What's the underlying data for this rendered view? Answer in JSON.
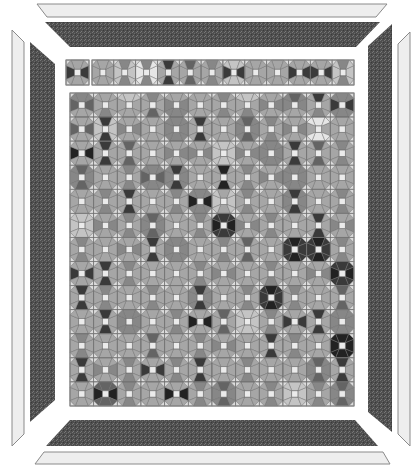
{
  "canvas": {
    "width": 413,
    "height": 474,
    "background": "#ffffff"
  },
  "palette": {
    "0": "#e6e6e6",
    "1": "#c4c4c4",
    "2": "#a6a6a6",
    "3": "#878787",
    "4": "#646464",
    "5": "#3a3a3a",
    "6": "#222222",
    "center": "#ebebeb",
    "corner": "#dcdcdc",
    "seam": "#6e6e6e",
    "border_dark": "#4e4e4e",
    "border_light": "#eeeeee",
    "border_outline": "#8a8a8a"
  },
  "borders": {
    "outer_light": {
      "top": [
        [
          37,
          4
        ],
        [
          387,
          4
        ],
        [
          376,
          17
        ],
        [
          47,
          17
        ]
      ],
      "bottom": [
        [
          44,
          452
        ],
        [
          383,
          452
        ],
        [
          390,
          464
        ],
        [
          35,
          464
        ]
      ],
      "left": [
        [
          12,
          30
        ],
        [
          24,
          42
        ],
        [
          24,
          434
        ],
        [
          12,
          446
        ]
      ],
      "right": [
        [
          410,
          32
        ],
        [
          398,
          44
        ],
        [
          398,
          434
        ],
        [
          410,
          446
        ]
      ]
    },
    "inner_dark": {
      "top": [
        [
          45,
          22
        ],
        [
          380,
          22
        ],
        [
          356,
          47
        ],
        [
          70,
          47
        ]
      ],
      "bottom": [
        [
          70,
          420
        ],
        [
          355,
          420
        ],
        [
          378,
          446
        ],
        [
          46,
          446
        ]
      ],
      "left": [
        [
          30,
          42
        ],
        [
          55,
          64
        ],
        [
          55,
          400
        ],
        [
          30,
          422
        ]
      ],
      "right": [
        [
          392,
          24
        ],
        [
          368,
          46
        ],
        [
          368,
          412
        ],
        [
          392,
          432
        ]
      ]
    }
  },
  "top_strip": {
    "y": 60,
    "height": 25,
    "first_cell": {
      "x": 66,
      "width": 23,
      "petals": [
        2,
        5,
        2,
        5
      ]
    },
    "cells_x": 92,
    "cells_width": 262,
    "cells": [
      [
        2,
        2,
        2,
        2
      ],
      [
        3,
        1,
        3,
        1
      ],
      [
        3,
        0,
        3,
        0
      ],
      [
        5,
        2,
        5,
        2
      ],
      [
        4,
        2,
        4,
        2
      ],
      [
        3,
        2,
        3,
        2
      ],
      [
        1,
        5,
        1,
        5
      ],
      [
        2,
        2,
        2,
        2
      ],
      [
        2,
        2,
        2,
        2
      ],
      [
        2,
        5,
        2,
        5
      ],
      [
        2,
        5,
        2,
        5
      ],
      [
        3,
        1,
        3,
        1
      ]
    ]
  },
  "main_grid": {
    "x": 70,
    "y": 93,
    "width": 284,
    "height": 313,
    "cols": 12,
    "rows": 13,
    "blocks": [
      [
        [
          3,
          4,
          2,
          4
        ],
        [
          2,
          2,
          3,
          2
        ],
        [
          1,
          2,
          2,
          2
        ],
        [
          3,
          2,
          4,
          2
        ],
        [
          2,
          3,
          3,
          3
        ],
        [
          2,
          2,
          2,
          2
        ],
        [
          3,
          2,
          3,
          2
        ],
        [
          1,
          2,
          3,
          2
        ],
        [
          2,
          3,
          2,
          3
        ],
        [
          4,
          3,
          2,
          3
        ],
        [
          5,
          2,
          3,
          2
        ],
        [
          3,
          5,
          3,
          5
        ]
      ],
      [
        [
          2,
          4,
          2,
          4
        ],
        [
          5,
          1,
          5,
          1
        ],
        [
          2,
          3,
          2,
          3
        ],
        [
          2,
          2,
          2,
          2
        ],
        [
          3,
          3,
          3,
          3
        ],
        [
          5,
          2,
          5,
          2
        ],
        [
          2,
          2,
          2,
          2
        ],
        [
          4,
          3,
          4,
          3
        ],
        [
          3,
          2,
          3,
          2
        ],
        [
          2,
          3,
          2,
          3
        ],
        [
          0,
          2,
          0,
          2
        ],
        [
          2,
          2,
          2,
          2
        ]
      ],
      [
        [
          2,
          6,
          2,
          6
        ],
        [
          5,
          2,
          5,
          2
        ],
        [
          4,
          2,
          4,
          2
        ],
        [
          2,
          2,
          2,
          2
        ],
        [
          2,
          3,
          2,
          3
        ],
        [
          2,
          3,
          2,
          3
        ],
        [
          1,
          1,
          1,
          1
        ],
        [
          2,
          3,
          2,
          3
        ],
        [
          3,
          3,
          3,
          3
        ],
        [
          5,
          2,
          5,
          2
        ],
        [
          4,
          2,
          4,
          2
        ],
        [
          3,
          2,
          3,
          2
        ]
      ],
      [
        [
          4,
          3,
          4,
          3
        ],
        [
          2,
          2,
          2,
          2
        ],
        [
          3,
          2,
          3,
          2
        ],
        [
          3,
          4,
          3,
          4
        ],
        [
          5,
          3,
          5,
          3
        ],
        [
          2,
          2,
          2,
          2
        ],
        [
          6,
          2,
          6,
          2
        ],
        [
          3,
          2,
          3,
          2
        ],
        [
          2,
          3,
          2,
          3
        ],
        [
          3,
          3,
          3,
          3
        ],
        [
          2,
          2,
          2,
          2
        ],
        [
          2,
          2,
          2,
          2
        ]
      ],
      [
        [
          2,
          2,
          2,
          2
        ],
        [
          3,
          2,
          3,
          2
        ],
        [
          5,
          2,
          5,
          2
        ],
        [
          2,
          2,
          2,
          2
        ],
        [
          3,
          2,
          3,
          2
        ],
        [
          3,
          6,
          3,
          6
        ],
        [
          2,
          1,
          2,
          1
        ],
        [
          3,
          2,
          3,
          2
        ],
        [
          2,
          2,
          2,
          2
        ],
        [
          5,
          3,
          5,
          3
        ],
        [
          2,
          2,
          2,
          2
        ],
        [
          3,
          2,
          3,
          2
        ]
      ],
      [
        [
          1,
          1,
          1,
          1
        ],
        [
          2,
          3,
          2,
          3
        ],
        [
          3,
          2,
          3,
          2
        ],
        [
          4,
          3,
          4,
          3
        ],
        [
          2,
          2,
          2,
          2
        ],
        [
          3,
          2,
          3,
          2
        ],
        [
          5,
          6,
          5,
          6
        ],
        [
          2,
          3,
          2,
          3
        ],
        [
          3,
          2,
          3,
          2
        ],
        [
          2,
          2,
          2,
          2
        ],
        [
          5,
          2,
          5,
          2
        ],
        [
          2,
          3,
          2,
          3
        ]
      ],
      [
        [
          3,
          2,
          3,
          2
        ],
        [
          2,
          2,
          2,
          2
        ],
        [
          2,
          3,
          2,
          3
        ],
        [
          5,
          2,
          5,
          2
        ],
        [
          3,
          3,
          3,
          3
        ],
        [
          2,
          2,
          2,
          2
        ],
        [
          3,
          2,
          3,
          2
        ],
        [
          4,
          2,
          4,
          2
        ],
        [
          2,
          2,
          2,
          2
        ],
        [
          6,
          5,
          6,
          5
        ],
        [
          6,
          5,
          6,
          5
        ],
        [
          3,
          2,
          3,
          2
        ]
      ],
      [
        [
          2,
          5,
          2,
          5
        ],
        [
          5,
          2,
          5,
          2
        ],
        [
          3,
          2,
          3,
          2
        ],
        [
          2,
          2,
          2,
          2
        ],
        [
          2,
          2,
          2,
          2
        ],
        [
          3,
          2,
          3,
          2
        ],
        [
          2,
          3,
          2,
          3
        ],
        [
          2,
          2,
          2,
          2
        ],
        [
          3,
          2,
          3,
          2
        ],
        [
          2,
          2,
          2,
          2
        ],
        [
          2,
          3,
          2,
          3
        ],
        [
          5,
          6,
          5,
          6
        ]
      ],
      [
        [
          5,
          2,
          5,
          2
        ],
        [
          3,
          2,
          3,
          2
        ],
        [
          2,
          2,
          2,
          2
        ],
        [
          3,
          2,
          3,
          2
        ],
        [
          2,
          2,
          2,
          2
        ],
        [
          5,
          3,
          5,
          3
        ],
        [
          2,
          2,
          2,
          2
        ],
        [
          3,
          2,
          3,
          2
        ],
        [
          6,
          5,
          6,
          5
        ],
        [
          3,
          2,
          3,
          2
        ],
        [
          2,
          2,
          2,
          2
        ],
        [
          4,
          2,
          4,
          2
        ]
      ],
      [
        [
          2,
          2,
          2,
          2
        ],
        [
          5,
          2,
          5,
          2
        ],
        [
          3,
          3,
          3,
          3
        ],
        [
          2,
          2,
          2,
          2
        ],
        [
          3,
          2,
          3,
          2
        ],
        [
          2,
          6,
          2,
          6
        ],
        [
          4,
          2,
          4,
          2
        ],
        [
          1,
          1,
          1,
          1
        ],
        [
          3,
          2,
          3,
          2
        ],
        [
          2,
          5,
          2,
          5
        ],
        [
          5,
          2,
          5,
          2
        ],
        [
          3,
          3,
          3,
          3
        ]
      ],
      [
        [
          3,
          2,
          3,
          2
        ],
        [
          2,
          2,
          2,
          2
        ],
        [
          2,
          2,
          2,
          2
        ],
        [
          4,
          2,
          4,
          2
        ],
        [
          2,
          2,
          2,
          2
        ],
        [
          3,
          2,
          3,
          2
        ],
        [
          2,
          3,
          2,
          3
        ],
        [
          2,
          2,
          2,
          2
        ],
        [
          5,
          2,
          5,
          2
        ],
        [
          3,
          2,
          3,
          2
        ],
        [
          2,
          2,
          2,
          2
        ],
        [
          6,
          6,
          6,
          6
        ]
      ],
      [
        [
          5,
          2,
          5,
          2
        ],
        [
          2,
          3,
          2,
          3
        ],
        [
          3,
          2,
          3,
          2
        ],
        [
          2,
          5,
          2,
          5
        ],
        [
          3,
          2,
          3,
          2
        ],
        [
          5,
          2,
          5,
          2
        ],
        [
          2,
          2,
          2,
          2
        ],
        [
          3,
          2,
          3,
          2
        ],
        [
          2,
          2,
          2,
          2
        ],
        [
          2,
          2,
          2,
          2
        ],
        [
          4,
          3,
          4,
          3
        ],
        [
          5,
          2,
          5,
          2
        ]
      ],
      [
        [
          2,
          2,
          2,
          2
        ],
        [
          4,
          6,
          4,
          6
        ],
        [
          3,
          2,
          3,
          2
        ],
        [
          2,
          2,
          2,
          2
        ],
        [
          2,
          6,
          2,
          6
        ],
        [
          3,
          2,
          3,
          2
        ],
        [
          4,
          3,
          4,
          3
        ],
        [
          2,
          2,
          2,
          2
        ],
        [
          3,
          2,
          3,
          2
        ],
        [
          1,
          1,
          1,
          1
        ],
        [
          3,
          2,
          3,
          2
        ],
        [
          4,
          3,
          4,
          3
        ]
      ]
    ]
  }
}
